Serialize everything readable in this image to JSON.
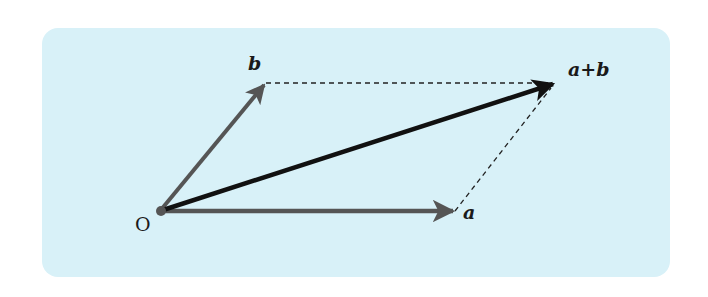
{
  "diagram": {
    "background_color": "#d8f1f8",
    "origin": {
      "label": "O",
      "x": 160,
      "y": 211
    },
    "vectors": [
      {
        "id": "a",
        "label": "a",
        "from": [
          160,
          211
        ],
        "to": [
          455,
          211
        ],
        "color": "#555555",
        "style": "solid"
      },
      {
        "id": "b",
        "label": "b",
        "from": [
          160,
          211
        ],
        "to": [
          266,
          83
        ],
        "color": "#555555",
        "style": "solid"
      },
      {
        "id": "a_plus_b",
        "label": "a+b",
        "from": [
          160,
          211
        ],
        "to": [
          555,
          83
        ],
        "color": "#111111",
        "style": "solid"
      }
    ],
    "dashed_lines": [
      {
        "from": [
          266,
          83
        ],
        "to": [
          555,
          83
        ]
      },
      {
        "from": [
          455,
          211
        ],
        "to": [
          555,
          83
        ]
      }
    ],
    "labels": {
      "origin": "O",
      "a": "a",
      "b": "b",
      "sum": "a+b"
    }
  }
}
